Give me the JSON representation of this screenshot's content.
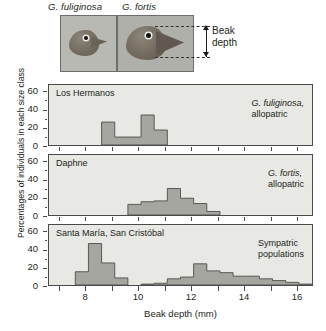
{
  "figure": {
    "photo_labels": {
      "left": "G. fuliginosa",
      "right": "G. fortis"
    },
    "annotation": {
      "beak_depth_line1": "Beak",
      "beak_depth_line2": "depth"
    }
  },
  "chart_data": {
    "type": "bar",
    "title": "",
    "xlabel": "Beak depth (mm)",
    "ylabel": "Percentages of individuals in each size class",
    "xlim": [
      6.6,
      16.6
    ],
    "ylim": [
      0,
      68
    ],
    "ytick_labels": [
      "0",
      "20",
      "40",
      "60"
    ],
    "ytick_values": [
      0,
      20,
      40,
      60
    ],
    "xtick_labels": [
      "8",
      "10",
      "12",
      "14",
      "16"
    ],
    "xtick_values": [
      8,
      10,
      12,
      14,
      16
    ],
    "grid": false,
    "bin_width": 0.5,
    "panels": [
      {
        "title": "Los Hermanos",
        "note": "G. fuliginosa,\nallopatric",
        "series": [
          {
            "name": "G. fuliginosa",
            "bin_starts": [
              8.6,
              9.1,
              9.6,
              10.1,
              10.6
            ],
            "values": [
              26,
              9,
              9,
              34,
              17
            ]
          }
        ]
      },
      {
        "title": "Daphne",
        "note": "G. fortis,\nallopatric",
        "series": [
          {
            "name": "G. fortis",
            "bin_starts": [
              9.6,
              10.1,
              10.6,
              11.1,
              11.6,
              12.1,
              12.6
            ],
            "values": [
              12,
              15,
              16,
              30,
              19,
              13,
              4
            ]
          }
        ]
      },
      {
        "title": "Santa María, San Cristóbal",
        "note": "Sympatric\npopulations",
        "series": [
          {
            "name": "G. fuliginosa",
            "bin_starts": [
              7.6,
              8.1,
              8.6,
              9.1
            ],
            "values": [
              15,
              47,
              25,
              8
            ]
          },
          {
            "name": "G. fortis",
            "bin_starts": [
              10.1,
              10.6,
              11.1,
              11.6,
              12.1,
              12.6,
              13.1,
              13.6,
              14.1,
              14.6,
              15.1,
              15.6,
              16.1
            ],
            "values": [
              1,
              2,
              7,
              9,
              24,
              16,
              14,
              10,
              10,
              7,
              5,
              3,
              1
            ]
          }
        ]
      }
    ],
    "colors": {
      "panel_background": "#e8e8e4",
      "bar_fill": "#a6a6a0",
      "bar_edge": "#4a4a4a",
      "axis": "#4a4a4a",
      "text": "#231f20"
    }
  }
}
